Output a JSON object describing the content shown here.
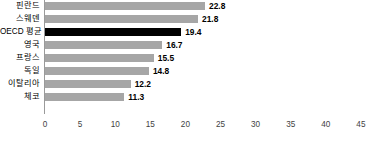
{
  "chart_data": {
    "type": "bar",
    "orientation": "horizontal",
    "title": "",
    "subtitle": "",
    "xlabel": "",
    "ylabel": "",
    "categories": [
      "핀란드",
      "스웨덴",
      "OECD 평균",
      "영국",
      "프랑스",
      "독일",
      "이탈리아",
      "체코"
    ],
    "values": [
      22.8,
      21.8,
      19.4,
      16.7,
      15.5,
      14.8,
      12.2,
      11.3
    ],
    "value_labels": [
      "22.8",
      "21.8",
      "19.4",
      "16.7",
      "15.5",
      "14.8",
      "12.2",
      "11.3"
    ],
    "highlight_category": "OECD 평균",
    "xlim": [
      0,
      47
    ],
    "xticks": [
      0,
      5,
      10,
      15,
      20,
      25,
      30,
      35,
      40,
      45
    ],
    "xtick_labels": [
      "0",
      "5",
      "10",
      "15",
      "20",
      "25",
      "30",
      "35",
      "40",
      "45"
    ],
    "grid": false,
    "legend": false,
    "bar_color": "#a6a6a6",
    "highlight_color": "#000000",
    "axis_color": "#9a9a9a",
    "label_color": "#000000",
    "tick_color": "#3f3f3f"
  }
}
